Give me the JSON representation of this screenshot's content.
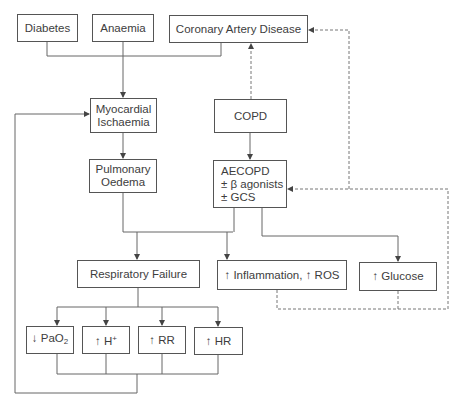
{
  "diagram": {
    "title": "",
    "nodes": {
      "diabetes": {
        "label": "Diabetes"
      },
      "anaemia": {
        "label": "Anaemia"
      },
      "cad": {
        "label": "Coronary Artery Disease"
      },
      "myocardial_ischaemia": {
        "line1": "Myocardial",
        "line2": "Ischaemia"
      },
      "copd": {
        "label": "COPD"
      },
      "pulmonary_oedema": {
        "line1": "Pulmonary",
        "line2": "Oedema"
      },
      "aecopd": {
        "line1": "AECOPD",
        "line2": "± β agonists",
        "line3": "± GCS"
      },
      "respiratory_failure": {
        "label": "Respiratory Failure"
      },
      "inflammation": {
        "label": "↑ Inflammation, ↑ ROS"
      },
      "glucose": {
        "label": "↑ Glucose"
      },
      "pao2": {
        "prefix": "↓ PaO",
        "sub": "2"
      },
      "h_plus": {
        "prefix": "↑ H",
        "sup": "+"
      },
      "rr": {
        "label": "↑ RR"
      },
      "hr": {
        "label": "↑ HR"
      }
    },
    "edges": [
      {
        "from": "diabetes",
        "to": "myocardial_ischaemia",
        "style": "solid"
      },
      {
        "from": "anaemia",
        "to": "myocardial_ischaemia",
        "style": "solid"
      },
      {
        "from": "cad",
        "to": "myocardial_ischaemia",
        "style": "solid"
      },
      {
        "from": "copd",
        "to": "cad",
        "style": "dashed"
      },
      {
        "from": "copd",
        "to": "aecopd",
        "style": "solid"
      },
      {
        "from": "myocardial_ischaemia",
        "to": "pulmonary_oedema",
        "style": "solid"
      },
      {
        "from": "pulmonary_oedema",
        "to": "respiratory_failure",
        "style": "solid"
      },
      {
        "from": "pulmonary_oedema",
        "to": "inflammation",
        "style": "solid"
      },
      {
        "from": "aecopd",
        "to": "respiratory_failure",
        "style": "solid"
      },
      {
        "from": "aecopd",
        "to": "inflammation",
        "style": "solid"
      },
      {
        "from": "aecopd",
        "to": "glucose",
        "style": "solid"
      },
      {
        "from": "respiratory_failure",
        "to": "pao2",
        "style": "solid"
      },
      {
        "from": "respiratory_failure",
        "to": "h_plus",
        "style": "solid"
      },
      {
        "from": "respiratory_failure",
        "to": "rr",
        "style": "solid"
      },
      {
        "from": "respiratory_failure",
        "to": "hr",
        "style": "solid"
      },
      {
        "from": "pao2|h_plus|rr|hr",
        "to": "myocardial_ischaemia",
        "style": "solid"
      },
      {
        "from": "inflammation|glucose",
        "to": "aecopd",
        "style": "dashed"
      },
      {
        "from": "inflammation|glucose",
        "to": "cad",
        "style": "dashed"
      }
    ],
    "colors": {
      "line": "#555555",
      "text": "#3d3d3d",
      "background": "#ffffff"
    }
  }
}
